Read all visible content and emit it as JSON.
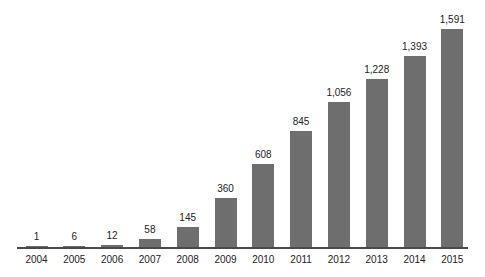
{
  "chart_data": {
    "type": "bar",
    "title": "",
    "xlabel": "",
    "ylabel": "",
    "categories": [
      "2004",
      "2005",
      "2006",
      "2007",
      "2008",
      "2009",
      "2010",
      "2011",
      "2012",
      "2013",
      "2014",
      "2015"
    ],
    "values": [
      1,
      6,
      12,
      58,
      145,
      360,
      608,
      845,
      1056,
      1228,
      1393,
      1591
    ],
    "value_labels": [
      "1",
      "6",
      "12",
      "58",
      "145",
      "360",
      "608",
      "845",
      "1,056",
      "1,228",
      "1,393",
      "1,591"
    ],
    "ylim": [
      0,
      1591
    ],
    "grid": false,
    "legend": null,
    "bar_color": "#6e6e6e"
  }
}
